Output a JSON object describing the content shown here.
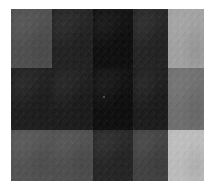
{
  "image": {
    "title": "Grayscale Block Mosaic",
    "description": "A 5 by 3 grid of flat grayscale rectangles with photographic film grain, centered on a white background.",
    "background_color": "#ffffff",
    "plate": {
      "left": 11,
      "top": 9,
      "width": 193,
      "height": 172
    }
  },
  "chart_data": {
    "type": "heatmap",
    "title": "",
    "xlabel": "",
    "ylabel": "",
    "columns": [
      "c1",
      "c2",
      "c3",
      "c4",
      "c5"
    ],
    "rows": [
      "r1",
      "r2",
      "r3"
    ],
    "column_widths": [
      41,
      41,
      40,
      35,
      36
    ],
    "row_heights": [
      59,
      62,
      51
    ],
    "value_scale": "grayscale luminance 0-255",
    "values": [
      [
        74,
        26,
        5,
        28,
        165
      ],
      [
        22,
        20,
        4,
        20,
        110
      ],
      [
        79,
        74,
        30,
        60,
        194
      ]
    ],
    "colors": [
      [
        "#4a4a4a",
        "#1a1a1a",
        "#050505",
        "#1c1c1c",
        "#a5a5a5"
      ],
      [
        "#161616",
        "#141414",
        "#040404",
        "#141414",
        "#6e6e6e"
      ],
      [
        "#4f4f4f",
        "#4a4a4a",
        "#1e1e1e",
        "#3c3c3c",
        "#c2c2c2"
      ]
    ],
    "cells": [
      {
        "row": 0,
        "col": 0,
        "name": "cell-r1-c1",
        "color": "#4a4a4a",
        "value": 74
      },
      {
        "row": 0,
        "col": 1,
        "name": "cell-r1-c2",
        "color": "#1a1a1a",
        "value": 26
      },
      {
        "row": 0,
        "col": 2,
        "name": "cell-r1-c3",
        "color": "#050505",
        "value": 5
      },
      {
        "row": 0,
        "col": 3,
        "name": "cell-r1-c4",
        "color": "#1c1c1c",
        "value": 28
      },
      {
        "row": 0,
        "col": 4,
        "name": "cell-r1-c5",
        "color": "#a5a5a5",
        "value": 165
      },
      {
        "row": 1,
        "col": 0,
        "name": "cell-r2-c1",
        "color": "#161616",
        "value": 22
      },
      {
        "row": 1,
        "col": 1,
        "name": "cell-r2-c2",
        "color": "#141414",
        "value": 20
      },
      {
        "row": 1,
        "col": 2,
        "name": "cell-r2-c3",
        "color": "#040404",
        "value": 4
      },
      {
        "row": 1,
        "col": 3,
        "name": "cell-r2-c4",
        "color": "#141414",
        "value": 20
      },
      {
        "row": 1,
        "col": 4,
        "name": "cell-r2-c5",
        "color": "#6e6e6e",
        "value": 110
      },
      {
        "row": 2,
        "col": 0,
        "name": "cell-r3-c1",
        "color": "#4f4f4f",
        "value": 79
      },
      {
        "row": 2,
        "col": 1,
        "name": "cell-r3-c2",
        "color": "#4a4a4a",
        "value": 74
      },
      {
        "row": 2,
        "col": 2,
        "name": "cell-r3-c3",
        "color": "#1e1e1e",
        "value": 30
      },
      {
        "row": 2,
        "col": 3,
        "name": "cell-r3-c4",
        "color": "#3c3c3c",
        "value": 60
      },
      {
        "row": 2,
        "col": 4,
        "name": "cell-r3-c5",
        "color": "#c2c2c2",
        "value": 194
      }
    ],
    "annotations": [
      {
        "name": "center-speck",
        "x": 103,
        "y": 96,
        "color": "#4d4d4d"
      }
    ]
  }
}
